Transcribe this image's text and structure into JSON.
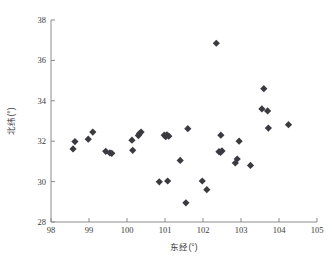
{
  "chart_data": {
    "type": "scatter",
    "title": "",
    "xlabel": "东经(°)",
    "ylabel": "北纬(°)",
    "xlim": [
      98,
      105
    ],
    "ylim": [
      28,
      38
    ],
    "xticks": [
      98,
      99,
      100,
      101,
      102,
      103,
      104,
      105
    ],
    "yticks": [
      28,
      30,
      32,
      34,
      36,
      38
    ],
    "xtick_labels": [
      "98",
      "99",
      "100",
      "101",
      "102",
      "103",
      "104",
      "105"
    ],
    "ytick_labels": [
      "28",
      "30",
      "32",
      "34",
      "36",
      "38"
    ],
    "grid": false,
    "legend": null,
    "marker": {
      "shape": "diamond",
      "color": "#3a3a40",
      "size": 3.6
    },
    "series": [
      {
        "name": "采样点",
        "points": [
          [
            98.58,
            31.62
          ],
          [
            98.63,
            31.98
          ],
          [
            98.98,
            32.1
          ],
          [
            99.1,
            32.45
          ],
          [
            99.44,
            31.5
          ],
          [
            99.55,
            31.42
          ],
          [
            99.6,
            31.4
          ],
          [
            100.13,
            32.05
          ],
          [
            100.15,
            31.55
          ],
          [
            100.3,
            32.28
          ],
          [
            100.33,
            32.38
          ],
          [
            100.37,
            32.45
          ],
          [
            100.85,
            29.99
          ],
          [
            100.98,
            32.3
          ],
          [
            101.02,
            32.22
          ],
          [
            101.05,
            32.32
          ],
          [
            101.07,
            30.03
          ],
          [
            101.1,
            32.25
          ],
          [
            101.4,
            31.05
          ],
          [
            101.55,
            28.95
          ],
          [
            101.6,
            32.62
          ],
          [
            101.98,
            30.03
          ],
          [
            102.1,
            29.6
          ],
          [
            102.35,
            36.85
          ],
          [
            102.42,
            31.48
          ],
          [
            102.46,
            31.45
          ],
          [
            102.5,
            31.52
          ],
          [
            102.47,
            32.3
          ],
          [
            102.85,
            30.92
          ],
          [
            102.9,
            31.12
          ],
          [
            102.95,
            32.0
          ],
          [
            103.25,
            30.8
          ],
          [
            103.55,
            33.6
          ],
          [
            103.6,
            34.6
          ],
          [
            103.7,
            33.5
          ],
          [
            103.72,
            32.65
          ],
          [
            104.25,
            32.82
          ]
        ]
      }
    ]
  },
  "axes": {
    "x_title": "东经(°)",
    "y_title": "北纬(°)"
  }
}
